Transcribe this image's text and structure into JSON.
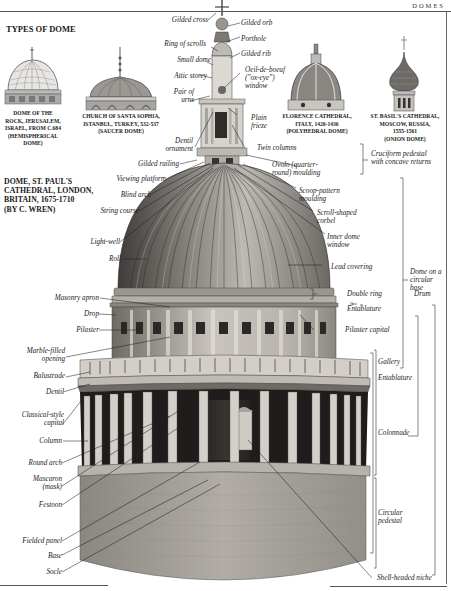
{
  "header": {
    "section": "DOMES"
  },
  "types_heading": "TYPES OF DOME",
  "dome_types": [
    {
      "lines": [
        "DOME OF THE",
        "ROCK, JERUSALEM,",
        "ISRAEL, FROM C.684",
        "(HEMISPHERICAL",
        "DOME)"
      ]
    },
    {
      "lines": [
        "CHURCH OF SANTA SOPHIA,",
        "ISTANBUL, TURKEY, 532-537",
        "(SAUCER DOME)"
      ]
    },
    {
      "lines": [
        "FLORENCE CATHEDRAL,",
        "ITALY, 1420-1436",
        "(POLYHEDRAL DOME)"
      ]
    },
    {
      "lines": [
        "ST. BASIL'S CATHEDRAL,",
        "MOSCOW, RUSSIA,",
        "1555-1561",
        "(ONION DOME)"
      ]
    }
  ],
  "main_title": [
    "DOME, ST. PAUL'S",
    "CATHEDRAL, LONDON,",
    "BRITAIN, 1675-1710",
    "(BY C. WREN)"
  ],
  "labels_left": {
    "gilded_cross": "Gilded cross",
    "ring_of_scrolls": "Ring of scrolls",
    "small_dome": "Small dome",
    "attic_storey": "Attic storey",
    "pair_of_urns_1": "Pair of",
    "pair_of_urns_2": "urns",
    "dentil_ornament_1": "Dentil",
    "dentil_ornament_2": "ornament",
    "gilded_railing": "Gilded railing",
    "viewing_platform": "Viewing platform",
    "blind_arch": "Blind arch",
    "string_course": "String course",
    "light_well": "Light-well",
    "roll": "Roll",
    "masonry_apron": "Masonry apron",
    "drop": "Drop",
    "pilaster": "Pilaster",
    "marble_filled_1": "Marble-filled",
    "marble_filled_2": "opening",
    "balustrade": "Balustrade",
    "dentil": "Dentil",
    "classical_capital_1": "Classical-style",
    "classical_capital_2": "capital",
    "column": "Column",
    "round_arch": "Round arch",
    "mascaron_1": "Mascaron",
    "mascaron_2": "(mask)",
    "festoon": "Festoon",
    "fielded_panel": "Fielded panel",
    "base": "Base",
    "socle": "Socle"
  },
  "labels_right": {
    "gilded_orb": "Gilded orb",
    "porthole": "Porthole",
    "gilded_rib": "Gilded rib",
    "oeil_1": "Oeil-de-boeuf",
    "oeil_2": "(\"ox-eye\")",
    "oeil_3": "window",
    "plain_frieze_1": "Plain",
    "plain_frieze_2": "frieze",
    "twin_columns": "Twin columns",
    "ovolo_1": "Ovolo (quarter-",
    "ovolo_2": "round) moulding",
    "scoop_1": "Scoop-pattern",
    "scoop_2": "moulding",
    "scroll_1": "Scroll-shaped",
    "scroll_2": "corbel",
    "inner_dome_1": "Inner dome",
    "inner_dome_2": "window",
    "lead_covering": "Lead covering",
    "double_ring": "Double ring",
    "entablature_upper": "Entablature",
    "pilaster_capital": "Pilaster capital",
    "gallery": "Gallery",
    "entablature_lower": "Entablature",
    "colonnade": "Colonnade",
    "circular_pedestal_1": "Circular",
    "circular_pedestal_2": "pedestal",
    "shell_niche": "Shell-headed niche"
  },
  "brackets": {
    "cruciform_1": "Cruciform pedestal",
    "cruciform_2": "with concave returns",
    "dome_base_1": "Dome on a",
    "dome_base_2": "circular",
    "dome_base_3": "base",
    "drum": "Drum"
  },
  "colors": {
    "ink": "#1a1a1a",
    "stone_light": "#d9d6d0",
    "stone_mid": "#a9a59e",
    "stone_dark": "#5e5a55",
    "lead": "#7d7a76"
  }
}
